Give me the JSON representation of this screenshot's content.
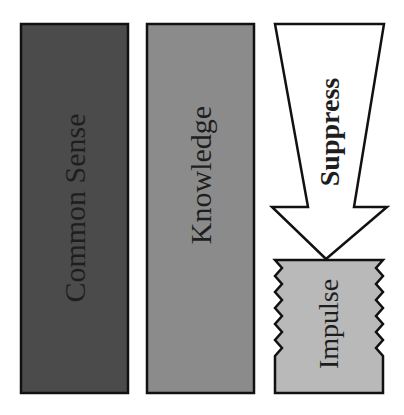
{
  "diagram": {
    "columns": [
      {
        "id": "common-sense",
        "label": "Common Sense",
        "fill": "#4b4b4b",
        "text_color": "#1e1e1e"
      },
      {
        "id": "knowledge",
        "label": "Knowledge",
        "fill": "#8b8b8b",
        "text_color": "#1e1e1e"
      }
    ],
    "arrow": {
      "label": "Suppress",
      "fill": "#ffffff",
      "direction": "down"
    },
    "target": {
      "label": "Impulse",
      "fill": "#b9b9b9",
      "edge_style": "zigzag"
    },
    "stroke_color": "#111111",
    "background": "#ffffff"
  }
}
